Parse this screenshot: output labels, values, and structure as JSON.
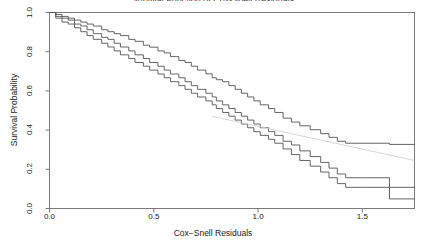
{
  "chart_data": {
    "type": "line",
    "title": "Survival Function of Cox-Snell Residuals",
    "xlabel": "Cox−Snell Residuals",
    "ylabel": "Survival Probability",
    "xlim": [
      0.0,
      1.75
    ],
    "ylim": [
      0.0,
      1.0
    ],
    "xticks": [
      "0.0",
      "0.5",
      "1.0",
      "1.5"
    ],
    "xtick_values": [
      0.0,
      0.5,
      1.0,
      1.5
    ],
    "yticks": [
      "0.0",
      "0.2",
      "0.4",
      "0.6",
      "0.8",
      "1.0"
    ],
    "ytick_values": [
      0.0,
      0.2,
      0.4,
      0.6,
      0.8,
      1.0
    ],
    "grid": false,
    "legend": "none",
    "box": true,
    "step_type": "post",
    "line_color": "#555555",
    "reference_color": "#cccccc",
    "background": "#ffffff",
    "series": [
      {
        "name": "Upper confidence band",
        "style": "step",
        "color": "#555555",
        "points": [
          [
            0.0,
            1.0
          ],
          [
            0.03,
            0.99
          ],
          [
            0.06,
            0.98
          ],
          [
            0.09,
            0.971
          ],
          [
            0.12,
            0.961
          ],
          [
            0.15,
            0.951
          ],
          [
            0.18,
            0.941
          ],
          [
            0.21,
            0.931
          ],
          [
            0.25,
            0.912
          ],
          [
            0.28,
            0.902
          ],
          [
            0.31,
            0.892
          ],
          [
            0.34,
            0.882
          ],
          [
            0.38,
            0.863
          ],
          [
            0.41,
            0.853
          ],
          [
            0.45,
            0.833
          ],
          [
            0.48,
            0.823
          ],
          [
            0.52,
            0.804
          ],
          [
            0.55,
            0.794
          ],
          [
            0.58,
            0.775
          ],
          [
            0.62,
            0.755
          ],
          [
            0.65,
            0.745
          ],
          [
            0.68,
            0.726
          ],
          [
            0.71,
            0.706
          ],
          [
            0.75,
            0.687
          ],
          [
            0.78,
            0.667
          ],
          [
            0.8,
            0.657
          ],
          [
            0.83,
            0.647
          ],
          [
            0.86,
            0.627
          ],
          [
            0.89,
            0.608
          ],
          [
            0.92,
            0.588
          ],
          [
            0.95,
            0.569
          ],
          [
            0.98,
            0.549
          ],
          [
            1.01,
            0.529
          ],
          [
            1.05,
            0.51
          ],
          [
            1.08,
            0.49
          ],
          [
            1.12,
            0.461
          ],
          [
            1.16,
            0.441
          ],
          [
            1.2,
            0.422
          ],
          [
            1.25,
            0.402
          ],
          [
            1.3,
            0.382
          ],
          [
            1.34,
            0.363
          ],
          [
            1.38,
            0.343
          ],
          [
            1.42,
            0.333
          ],
          [
            1.63,
            0.333
          ],
          [
            1.63,
            0.327
          ],
          [
            1.75,
            0.327
          ]
        ]
      },
      {
        "name": "Survival estimate",
        "style": "step",
        "color": "#555555",
        "points": [
          [
            0.0,
            1.0
          ],
          [
            0.03,
            0.98
          ],
          [
            0.06,
            0.971
          ],
          [
            0.09,
            0.961
          ],
          [
            0.12,
            0.941
          ],
          [
            0.15,
            0.931
          ],
          [
            0.18,
            0.912
          ],
          [
            0.21,
            0.892
          ],
          [
            0.25,
            0.873
          ],
          [
            0.28,
            0.863
          ],
          [
            0.31,
            0.843
          ],
          [
            0.34,
            0.824
          ],
          [
            0.38,
            0.804
          ],
          [
            0.41,
            0.784
          ],
          [
            0.45,
            0.765
          ],
          [
            0.48,
            0.745
          ],
          [
            0.52,
            0.726
          ],
          [
            0.55,
            0.706
          ],
          [
            0.58,
            0.686
          ],
          [
            0.62,
            0.667
          ],
          [
            0.65,
            0.647
          ],
          [
            0.68,
            0.627
          ],
          [
            0.71,
            0.608
          ],
          [
            0.75,
            0.588
          ],
          [
            0.78,
            0.569
          ],
          [
            0.8,
            0.549
          ],
          [
            0.83,
            0.529
          ],
          [
            0.86,
            0.51
          ],
          [
            0.89,
            0.49
          ],
          [
            0.92,
            0.471
          ],
          [
            0.95,
            0.451
          ],
          [
            0.98,
            0.431
          ],
          [
            1.01,
            0.412
          ],
          [
            1.05,
            0.392
          ],
          [
            1.08,
            0.373
          ],
          [
            1.12,
            0.343
          ],
          [
            1.16,
            0.324
          ],
          [
            1.2,
            0.294
          ],
          [
            1.25,
            0.265
          ],
          [
            1.3,
            0.235
          ],
          [
            1.34,
            0.206
          ],
          [
            1.38,
            0.176
          ],
          [
            1.42,
            0.157
          ],
          [
            1.5,
            0.157
          ],
          [
            1.63,
            0.157
          ],
          [
            1.63,
            0.108
          ],
          [
            1.75,
            0.108
          ]
        ]
      },
      {
        "name": "Lower confidence band",
        "style": "step",
        "color": "#555555",
        "points": [
          [
            0.0,
            1.0
          ],
          [
            0.03,
            0.971
          ],
          [
            0.06,
            0.951
          ],
          [
            0.09,
            0.941
          ],
          [
            0.12,
            0.922
          ],
          [
            0.15,
            0.902
          ],
          [
            0.18,
            0.882
          ],
          [
            0.21,
            0.863
          ],
          [
            0.25,
            0.843
          ],
          [
            0.28,
            0.824
          ],
          [
            0.31,
            0.804
          ],
          [
            0.34,
            0.784
          ],
          [
            0.38,
            0.765
          ],
          [
            0.41,
            0.745
          ],
          [
            0.45,
            0.726
          ],
          [
            0.48,
            0.706
          ],
          [
            0.52,
            0.686
          ],
          [
            0.55,
            0.667
          ],
          [
            0.58,
            0.647
          ],
          [
            0.62,
            0.627
          ],
          [
            0.65,
            0.608
          ],
          [
            0.68,
            0.588
          ],
          [
            0.71,
            0.569
          ],
          [
            0.75,
            0.549
          ],
          [
            0.78,
            0.529
          ],
          [
            0.8,
            0.51
          ],
          [
            0.83,
            0.49
          ],
          [
            0.86,
            0.471
          ],
          [
            0.89,
            0.451
          ],
          [
            0.92,
            0.431
          ],
          [
            0.95,
            0.412
          ],
          [
            0.98,
            0.392
          ],
          [
            1.01,
            0.373
          ],
          [
            1.05,
            0.353
          ],
          [
            1.08,
            0.333
          ],
          [
            1.12,
            0.304
          ],
          [
            1.16,
            0.275
          ],
          [
            1.2,
            0.245
          ],
          [
            1.25,
            0.216
          ],
          [
            1.3,
            0.186
          ],
          [
            1.34,
            0.157
          ],
          [
            1.38,
            0.127
          ],
          [
            1.42,
            0.108
          ],
          [
            1.5,
            0.108
          ],
          [
            1.63,
            0.108
          ],
          [
            1.63,
            0.049
          ],
          [
            1.75,
            0.049
          ]
        ]
      },
      {
        "name": "Reference line",
        "style": "line",
        "color": "#cccccc",
        "points": [
          [
            0.78,
            0.47
          ],
          [
            1.75,
            0.245
          ]
        ]
      }
    ]
  }
}
